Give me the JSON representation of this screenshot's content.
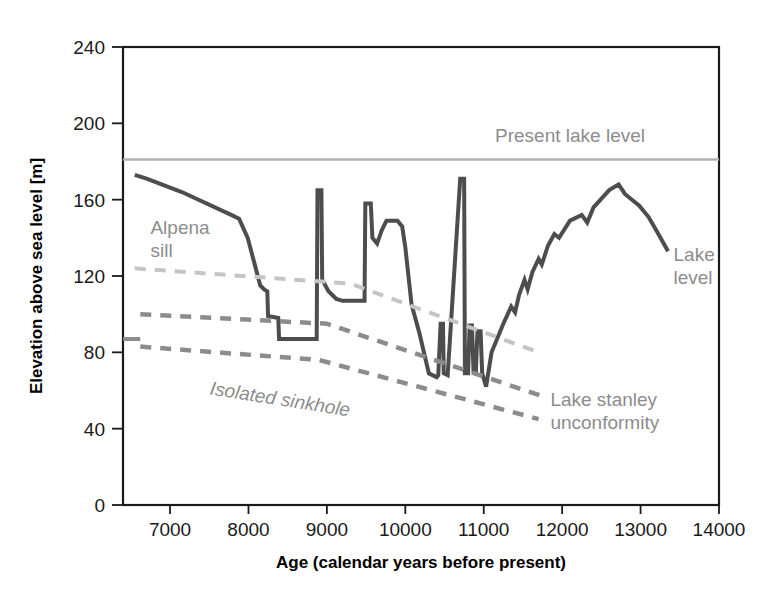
{
  "chart_data": {
    "type": "line",
    "title": "",
    "xlabel": "Age (calendar years before present)",
    "ylabel": "Elevation above sea level [m]",
    "xlim": [
      6400,
      14000
    ],
    "ylim": [
      0,
      240
    ],
    "xticks": [
      7000,
      8000,
      9000,
      10000,
      11000,
      12000,
      13000,
      14000
    ],
    "xtick_labels": [
      "7000",
      "8000",
      "9000",
      "10000",
      "11000",
      "12000",
      "13000",
      "14000"
    ],
    "yticks": [
      0,
      40,
      80,
      120,
      160,
      200,
      240
    ],
    "ytick_labels": [
      "0",
      "40",
      "80",
      "120",
      "160",
      "200",
      "240"
    ],
    "grid": false,
    "legend_position": "inline-annotations",
    "x_axis_direction": "increasing-left-to-right",
    "series": [
      {
        "name": "Lake level",
        "style": "solid",
        "color": "#4d4d4d",
        "width": 4,
        "points": [
          [
            6550,
            173
          ],
          [
            6700,
            171
          ],
          [
            7150,
            164
          ],
          [
            7780,
            152
          ],
          [
            7880,
            150
          ],
          [
            7990,
            140
          ],
          [
            8080,
            126
          ],
          [
            8150,
            115
          ],
          [
            8200,
            113
          ],
          [
            8240,
            112
          ],
          [
            8250,
            99
          ],
          [
            8380,
            98
          ],
          [
            8390,
            87
          ],
          [
            8870,
            87
          ],
          [
            8880,
            165
          ],
          [
            8930,
            165
          ],
          [
            8940,
            118
          ],
          [
            9020,
            112
          ],
          [
            9120,
            108
          ],
          [
            9200,
            107
          ],
          [
            9480,
            107
          ],
          [
            9490,
            158
          ],
          [
            9560,
            158
          ],
          [
            9580,
            140
          ],
          [
            9640,
            137
          ],
          [
            9700,
            144
          ],
          [
            9760,
            149
          ],
          [
            9900,
            149
          ],
          [
            9960,
            146
          ],
          [
            10000,
            135
          ],
          [
            10080,
            105
          ],
          [
            10180,
            90
          ],
          [
            10300,
            69
          ],
          [
            10400,
            67
          ],
          [
            10420,
            68
          ],
          [
            10450,
            95
          ],
          [
            10480,
            95
          ],
          [
            10490,
            69
          ],
          [
            10540,
            68
          ],
          [
            10700,
            171
          ],
          [
            10750,
            171
          ],
          [
            10760,
            69
          ],
          [
            10800,
            69
          ],
          [
            10820,
            94
          ],
          [
            10850,
            94
          ],
          [
            10870,
            70
          ],
          [
            10900,
            70
          ],
          [
            10920,
            91
          ],
          [
            10960,
            91
          ],
          [
            10980,
            69
          ],
          [
            11030,
            62
          ],
          [
            11100,
            80
          ],
          [
            11250,
            95
          ],
          [
            11350,
            104
          ],
          [
            11400,
            101
          ],
          [
            11450,
            110
          ],
          [
            11520,
            118
          ],
          [
            11560,
            113
          ],
          [
            11620,
            122
          ],
          [
            11700,
            129
          ],
          [
            11740,
            126
          ],
          [
            11820,
            136
          ],
          [
            11900,
            142
          ],
          [
            11960,
            140
          ],
          [
            12100,
            149
          ],
          [
            12250,
            152
          ],
          [
            12320,
            148
          ],
          [
            12400,
            156
          ],
          [
            12600,
            165
          ],
          [
            12720,
            168
          ],
          [
            12800,
            163
          ],
          [
            12980,
            157
          ],
          [
            13100,
            151
          ],
          [
            13200,
            144
          ],
          [
            13350,
            133
          ]
        ]
      },
      {
        "name": "Present lake level",
        "style": "solid",
        "color": "#b3b3b3",
        "width": 2.5,
        "value": 181,
        "points": [
          [
            6400,
            181
          ],
          [
            14000,
            181
          ]
        ]
      },
      {
        "name": "Alpena sill",
        "style": "dashed",
        "color": "#c4c4c4",
        "width": 4,
        "points": [
          [
            6550,
            124
          ],
          [
            9300,
            116
          ],
          [
            11700,
            80
          ]
        ]
      },
      {
        "name": "Isolated sinkhole upper",
        "style": "dashed",
        "color": "#8c8c8c",
        "width": 4.5,
        "points": [
          [
            6620,
            100
          ],
          [
            9000,
            95
          ],
          [
            11750,
            57
          ]
        ]
      },
      {
        "name": "Lake stanley unconformity",
        "style": "dashed",
        "color": "#8c8c8c",
        "width": 4.5,
        "points": [
          [
            6620,
            83
          ],
          [
            8900,
            76
          ],
          [
            11700,
            45
          ]
        ]
      },
      {
        "name": "Left gray marker segment",
        "style": "solid",
        "color": "#8c8c8c",
        "width": 4,
        "points": [
          [
            6400,
            87
          ],
          [
            6620,
            87
          ]
        ]
      }
    ],
    "annotations": [
      {
        "id": "present-lake-level",
        "text": "Present lake level",
        "x": 12100,
        "y": 190,
        "color": "#b3b3b3",
        "italic": false,
        "rotation": 0
      },
      {
        "id": "alpena-sill",
        "text": "Alpena sill",
        "x": 6750,
        "y": 142,
        "color": "#c4c4c4",
        "italic": false,
        "rotation": 0,
        "lines": [
          "Alpena",
          "sill"
        ]
      },
      {
        "id": "isolated-sinkhole",
        "text": "Isolated sinkhole",
        "x": 7500,
        "y": 58,
        "color": "#8c8c8c",
        "italic": true,
        "rotation": 9
      },
      {
        "id": "lake-stanley-unconformity",
        "text": "Lake stanley unconformity",
        "x": 11850,
        "y": 52,
        "color": "#8c8c8c",
        "italic": false,
        "rotation": 0,
        "lines": [
          "Lake stanley",
          "unconformity"
        ]
      },
      {
        "id": "lake-level",
        "text": "Lake level",
        "x": 13420,
        "y": 128,
        "color": "#8c8c8c",
        "italic": false,
        "rotation": 0,
        "lines": [
          "Lake",
          "level"
        ]
      }
    ]
  },
  "axes": {
    "x_title": "Age (calendar years before present)",
    "y_title": "Elevation above sea level [m]"
  },
  "ticks": {
    "x": [
      "7000",
      "8000",
      "9000",
      "10000",
      "11000",
      "12000",
      "13000",
      "14000"
    ],
    "y": [
      "240",
      "200",
      "160",
      "120",
      "80",
      "40",
      "0"
    ]
  },
  "labels": {
    "present_lake_level": "Present lake level",
    "alpena_sill_line1": "Alpena",
    "alpena_sill_line2": "sill",
    "isolated_sinkhole": "Isolated sinkhole",
    "lake_stanley_line1": "Lake stanley",
    "lake_stanley_line2": "unconformity",
    "lake_level_line1": "Lake",
    "lake_level_line2": "level"
  },
  "colors": {
    "frame": "#1a1a1a",
    "lake_level_line": "#4d4d4d",
    "present_level_line": "#b3b3b3",
    "alpena_dash": "#c4c4c4",
    "sinkhole_dash": "#8c8c8c",
    "annotation_gray": "#8c8c8c",
    "annotation_light_gray": "#b3b3b3"
  }
}
